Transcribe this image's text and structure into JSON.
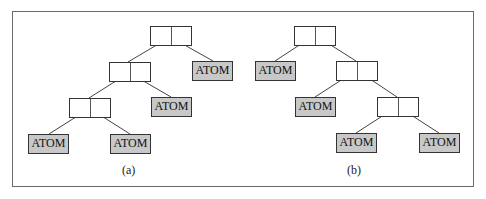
{
  "figure": {
    "diagrams": [
      {
        "caption": "(a)",
        "cons_cells": 3,
        "atoms": [
          "ATOM",
          "ATOM",
          "ATOM",
          "ATOM"
        ]
      },
      {
        "caption": "(b)",
        "cons_cells": 3,
        "atoms": [
          "ATOM",
          "ATOM",
          "ATOM",
          "ATOM"
        ]
      }
    ],
    "colors": {
      "atom_fill": "#c8c8c8",
      "border": "#333333",
      "frame": "#6a6a6a"
    }
  }
}
